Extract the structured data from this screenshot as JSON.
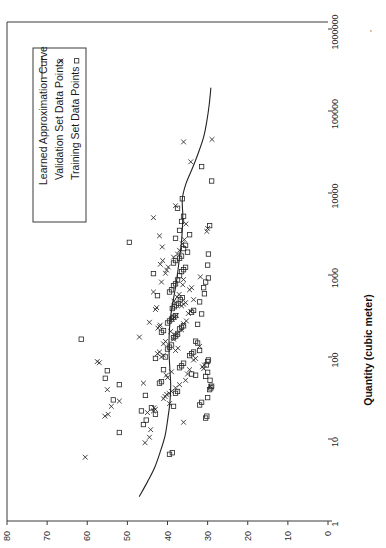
{
  "chart_data": {
    "type": "scatter",
    "title": "",
    "orientation": "rotated-90-ccw",
    "xlabel": "Quantity (cubic meter)",
    "ylabel": "",
    "xscale": "log",
    "yscale": "linear",
    "xlim": [
      1,
      1000000
    ],
    "ylim": [
      0,
      80
    ],
    "xticks": [
      1,
      10,
      100,
      1000,
      10000,
      100000,
      1000000
    ],
    "xtick_labels": [
      "1",
      "10",
      "100",
      "1000",
      "10000",
      "100000",
      "1000000"
    ],
    "yticks": [
      0,
      10,
      20,
      30,
      40,
      50,
      60,
      70,
      80
    ],
    "ytick_labels": [
      "0",
      "10",
      "20",
      "30",
      "40",
      "50",
      "60",
      "70",
      "80"
    ],
    "grid": false,
    "legend_position": "upper-left",
    "legend": [
      {
        "label": "Learned Approximation Curve",
        "marker": "line"
      },
      {
        "label": "Validation Set Data Points",
        "marker": "x"
      },
      {
        "label": "Training Set Data Points",
        "marker": "square"
      }
    ],
    "series": [
      {
        "name": "Learned Approximation Curve",
        "marker": "line",
        "points": [
          [
            2.0,
            47.0
          ],
          [
            3.0,
            45.0
          ],
          [
            4.5,
            43.2
          ],
          [
            7.0,
            41.8
          ],
          [
            11.0,
            40.6
          ],
          [
            18.0,
            39.9
          ],
          [
            28.0,
            39.4
          ],
          [
            45.0,
            39.2
          ],
          [
            70.0,
            39.4
          ],
          [
            110.0,
            39.6
          ],
          [
            170.0,
            39.6
          ],
          [
            260.0,
            39.4
          ],
          [
            400.0,
            38.9
          ],
          [
            620.0,
            38.2
          ],
          [
            950.0,
            37.6
          ],
          [
            1500.0,
            37.1
          ],
          [
            2300.0,
            36.6
          ],
          [
            3600.0,
            36.3
          ],
          [
            5500.0,
            36.2
          ],
          [
            8500.0,
            36.3
          ],
          [
            13000.0,
            35.4
          ],
          [
            20000.0,
            33.8
          ],
          [
            31000.0,
            32.3
          ],
          [
            48000.0,
            31.0
          ],
          [
            75000.0,
            30.2
          ],
          [
            120000.0,
            29.6
          ],
          [
            190000.0,
            29.2
          ]
        ]
      },
      {
        "name": "Validation Set Data Points",
        "marker": "x",
        "points": [
          [
            6.0,
            60.5
          ],
          [
            9.0,
            45.6
          ],
          [
            10.5,
            44.5
          ],
          [
            13.0,
            44.2
          ],
          [
            16.0,
            36.0
          ],
          [
            19.0,
            55.6
          ],
          [
            20.0,
            54.8
          ],
          [
            21.0,
            45.0
          ],
          [
            22.0,
            43.5
          ],
          [
            23.0,
            43.0
          ],
          [
            24.0,
            43.4
          ],
          [
            25.0,
            54.0
          ],
          [
            27.0,
            39.5
          ],
          [
            29.0,
            52.0
          ],
          [
            31.0,
            41.0
          ],
          [
            33.0,
            40.6
          ],
          [
            35.0,
            40.2
          ],
          [
            36.0,
            39.6
          ],
          [
            38.0,
            39.0
          ],
          [
            40.0,
            55.0
          ],
          [
            42.0,
            38.0
          ],
          [
            44.0,
            29.3
          ],
          [
            46.0,
            37.0
          ],
          [
            48.0,
            46.0
          ],
          [
            52.0,
            35.5
          ],
          [
            56.0,
            40.0
          ],
          [
            60.0,
            40.3
          ],
          [
            62.0,
            35.0
          ],
          [
            66.0,
            39.0
          ],
          [
            70.0,
            34.5
          ],
          [
            72.0,
            31.0
          ],
          [
            76.0,
            31.3
          ],
          [
            80.0,
            30.8
          ],
          [
            85.0,
            57.0
          ],
          [
            88.0,
            57.5
          ],
          [
            92.0,
            33.5
          ],
          [
            96.0,
            33.0
          ],
          [
            100.0,
            41.5
          ],
          [
            105.0,
            41.0
          ],
          [
            110.0,
            42.5
          ],
          [
            115.0,
            42.0
          ],
          [
            120.0,
            38.0
          ],
          [
            128.0,
            37.4
          ],
          [
            135.0,
            32.0
          ],
          [
            145.0,
            41.0
          ],
          [
            155.0,
            40.5
          ],
          [
            165.0,
            38.5
          ],
          [
            175.0,
            47.0
          ],
          [
            185.0,
            38.0
          ],
          [
            195.0,
            37.5
          ],
          [
            205.0,
            39.2
          ],
          [
            215.0,
            36.5
          ],
          [
            225.0,
            42.4
          ],
          [
            235.0,
            42.0
          ],
          [
            245.0,
            41.8
          ],
          [
            255.0,
            36.0
          ],
          [
            265.0,
            44.5
          ],
          [
            275.0,
            35.3
          ],
          [
            290.0,
            38.8
          ],
          [
            305.0,
            38.3
          ],
          [
            320.0,
            37.8
          ],
          [
            340.0,
            34.8
          ],
          [
            360.0,
            34.2
          ],
          [
            380.0,
            43.0
          ],
          [
            400.0,
            42.7
          ],
          [
            420.0,
            36.5
          ],
          [
            440.0,
            36.0
          ],
          [
            460.0,
            35.5
          ],
          [
            480.0,
            38.4
          ],
          [
            500.0,
            33.5
          ],
          [
            540.0,
            37.6
          ],
          [
            580.0,
            37.1
          ],
          [
            620.0,
            43.5
          ],
          [
            660.0,
            34.5
          ],
          [
            700.0,
            34.0
          ],
          [
            760.0,
            36.2
          ],
          [
            820.0,
            41.5
          ],
          [
            880.0,
            36.0
          ],
          [
            950.0,
            31.8
          ],
          [
            1050.0,
            40.5
          ],
          [
            1150.0,
            40.2
          ],
          [
            1250.0,
            39.8
          ],
          [
            1350.0,
            41.8
          ],
          [
            1500.0,
            41.2
          ],
          [
            1650.0,
            38.5
          ],
          [
            1800.0,
            37.5
          ],
          [
            2000.0,
            37.0
          ],
          [
            2200.0,
            41.3
          ],
          [
            2400.0,
            36.3
          ],
          [
            2700.0,
            35.8
          ],
          [
            3000.0,
            42.0
          ],
          [
            3400.0,
            30.2
          ],
          [
            3700.0,
            30.0
          ],
          [
            4200.0,
            35.4
          ],
          [
            5000.0,
            43.5
          ],
          [
            7000.0,
            38.0
          ],
          [
            24000.0,
            34.2
          ],
          [
            42000.0,
            36.0
          ],
          [
            45000.0,
            28.9
          ]
        ]
      },
      {
        "name": "Training Set Data Points",
        "marker": "square",
        "points": [
          [
            6.5,
            39.5
          ],
          [
            6.8,
            38.8
          ],
          [
            12.0,
            52.0
          ],
          [
            15.0,
            46.0
          ],
          [
            17.0,
            45.3
          ],
          [
            18.0,
            30.5
          ],
          [
            19.0,
            30.2
          ],
          [
            20.0,
            43.0
          ],
          [
            22.0,
            46.5
          ],
          [
            24.0,
            44.0
          ],
          [
            25.0,
            38.5
          ],
          [
            26.0,
            32.0
          ],
          [
            28.0,
            31.5
          ],
          [
            30.0,
            53.5
          ],
          [
            32.0,
            30.0
          ],
          [
            34.0,
            45.5
          ],
          [
            36.0,
            38.0
          ],
          [
            38.0,
            37.5
          ],
          [
            40.0,
            29.5
          ],
          [
            42.0,
            29.2
          ],
          [
            44.0,
            29.0
          ],
          [
            46.0,
            52.0
          ],
          [
            48.0,
            42.0
          ],
          [
            50.0,
            41.5
          ],
          [
            52.0,
            29.4
          ],
          [
            55.0,
            55.5
          ],
          [
            58.0,
            30.5
          ],
          [
            60.0,
            33.0
          ],
          [
            62.0,
            34.0
          ],
          [
            65.0,
            30.0
          ],
          [
            68.0,
            55.0
          ],
          [
            70.0,
            41.0
          ],
          [
            74.0,
            37.0
          ],
          [
            78.0,
            36.5
          ],
          [
            80.0,
            30.3
          ],
          [
            84.0,
            36.0
          ],
          [
            88.0,
            30.0
          ],
          [
            92.0,
            29.8
          ],
          [
            96.0,
            43.0
          ],
          [
            100.0,
            40.5
          ],
          [
            104.0,
            34.5
          ],
          [
            110.0,
            34.0
          ],
          [
            115.0,
            33.5
          ],
          [
            120.0,
            32.0
          ],
          [
            125.0,
            40.0
          ],
          [
            132.0,
            39.5
          ],
          [
            140.0,
            39.0
          ],
          [
            148.0,
            32.5
          ],
          [
            156.0,
            33.0
          ],
          [
            165.0,
            61.5
          ],
          [
            172.0,
            38.5
          ],
          [
            180.0,
            38.0
          ],
          [
            190.0,
            37.5
          ],
          [
            200.0,
            41.5
          ],
          [
            210.0,
            41.0
          ],
          [
            220.0,
            37.0
          ],
          [
            230.0,
            36.5
          ],
          [
            240.0,
            36.0
          ],
          [
            250.0,
            32.5
          ],
          [
            260.0,
            40.0
          ],
          [
            275.0,
            39.5
          ],
          [
            290.0,
            39.0
          ],
          [
            305.0,
            38.5
          ],
          [
            320.0,
            38.0
          ],
          [
            335.0,
            31.5
          ],
          [
            350.0,
            34.0
          ],
          [
            370.0,
            33.5
          ],
          [
            390.0,
            38.8
          ],
          [
            410.0,
            38.3
          ],
          [
            430.0,
            37.8
          ],
          [
            450.0,
            37.3
          ],
          [
            470.0,
            32.0
          ],
          [
            500.0,
            36.8
          ],
          [
            530.0,
            36.3
          ],
          [
            560.0,
            42.5
          ],
          [
            590.0,
            30.8
          ],
          [
            620.0,
            39.5
          ],
          [
            660.0,
            39.0
          ],
          [
            700.0,
            31.0
          ],
          [
            740.0,
            38.5
          ],
          [
            780.0,
            38.0
          ],
          [
            820.0,
            30.5
          ],
          [
            870.0,
            37.5
          ],
          [
            920.0,
            29.8
          ],
          [
            980.0,
            37.0
          ],
          [
            1040.0,
            43.5
          ],
          [
            1100.0,
            36.5
          ],
          [
            1160.0,
            36.0
          ],
          [
            1240.0,
            35.5
          ],
          [
            1320.0,
            30.0
          ],
          [
            1400.0,
            38.5
          ],
          [
            1500.0,
            38.0
          ],
          [
            1600.0,
            37.0
          ],
          [
            1700.0,
            36.5
          ],
          [
            1800.0,
            29.8
          ],
          [
            1900.0,
            35.0
          ],
          [
            2100.0,
            36.0
          ],
          [
            2300.0,
            35.5
          ],
          [
            2500.0,
            49.5
          ],
          [
            2800.0,
            38.0
          ],
          [
            3100.0,
            34.5
          ],
          [
            3500.0,
            37.0
          ],
          [
            4000.0,
            29.5
          ],
          [
            4500.0,
            36.5
          ],
          [
            5200.0,
            36.0
          ],
          [
            6500.0,
            37.5
          ],
          [
            8500.0,
            36.3
          ],
          [
            14000.0,
            29.0
          ],
          [
            21000.0,
            31.5
          ]
        ]
      }
    ]
  },
  "axes": {
    "x_axis_title": "Quantity (cubic meter)",
    "x_tick_labels": [
      "1",
      "10",
      "100",
      "1000",
      "10000",
      "100000",
      "1000000"
    ],
    "y_tick_labels": [
      "80",
      "70",
      "60",
      "50",
      "40",
      "30",
      "20",
      "10",
      "0"
    ]
  },
  "legend": {
    "items": [
      {
        "label": "Learned Approximation Curve",
        "marker": "line"
      },
      {
        "label": "Validation Set Data Points",
        "marker": "x"
      },
      {
        "label": "Training Set Data Points",
        "marker": "square"
      }
    ]
  },
  "colors": {
    "line": "#222222",
    "marker": "#262626",
    "axis": "#3a3a3a",
    "text": "#1a1a1a",
    "background": "#ffffff"
  }
}
